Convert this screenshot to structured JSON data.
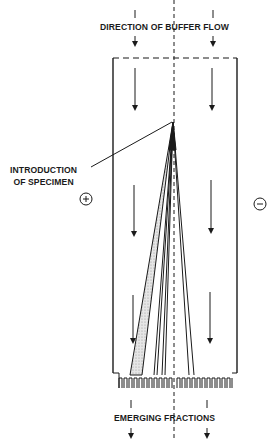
{
  "diagram": {
    "type": "continuous-flow electrophoresis schematic",
    "labels": {
      "top": "DIRECTION OF BUFFER FLOW",
      "specimen_line1": "INTRODUCTION",
      "specimen_line2": "OF SPECIMEN",
      "bottom": "EMERGING FRACTIONS"
    },
    "electrodes": {
      "left": "+",
      "right": "−"
    },
    "colors": {
      "line": "#1a1a1a",
      "band_fill": "#d8d8d8",
      "background": "#ffffff"
    },
    "flow_arrows_per_column": 3,
    "outlet_count": 24
  }
}
